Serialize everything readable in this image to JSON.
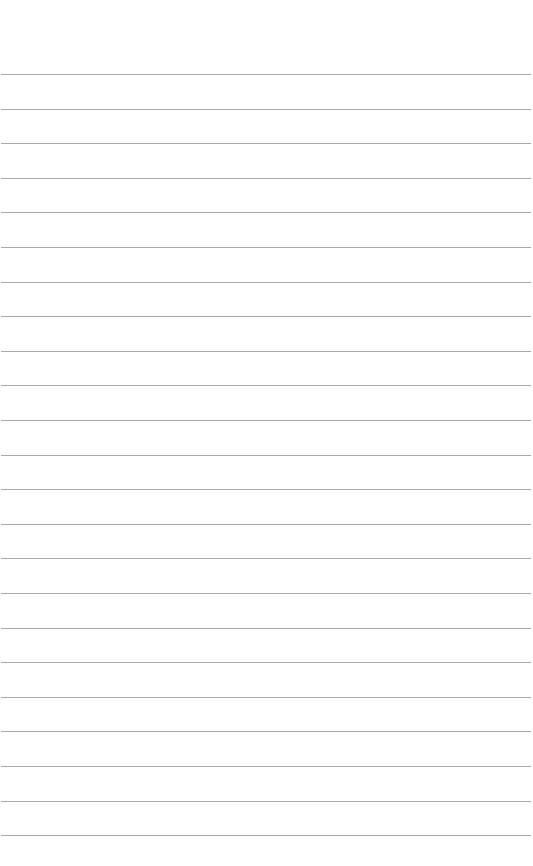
{
  "page": {
    "type": "lined-paper",
    "background": "#ffffff",
    "rule_color": "#9a9a9a",
    "rule_count": 23,
    "first_rule_y": 74,
    "rule_spacing": 34.6,
    "text": ""
  }
}
